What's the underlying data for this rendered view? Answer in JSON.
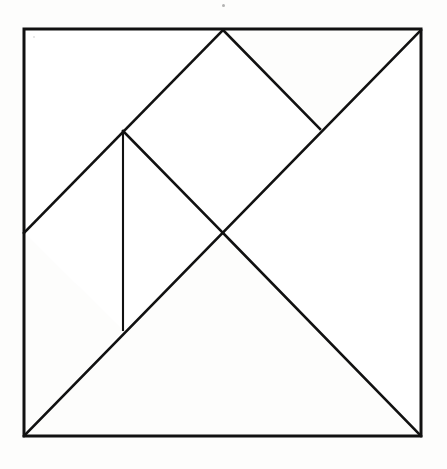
{
  "figure": {
    "kind": "tangram-dissection-diagram",
    "title": "",
    "background_color": "#fdfdfc",
    "stroke_color": "#111111",
    "outer_stroke_width": 3,
    "inner_stroke_width": 2,
    "canvas": {
      "width": 447,
      "height": 469
    }
  },
  "geometry": {
    "square": {
      "label": "outer-square",
      "top_left": [
        24,
        29
      ],
      "top_right": [
        421,
        30
      ],
      "bottom_right": [
        421,
        436
      ],
      "bottom_left": [
        24,
        436
      ],
      "width": 397,
      "height": 407
    },
    "points": {
      "A_top_left": [
        24,
        29
      ],
      "B_top_mid": [
        223,
        30
      ],
      "C_top_right": [
        421,
        30
      ],
      "D_right_small": [
        320,
        129
      ],
      "E_left_mid": [
        24,
        233
      ],
      "F_center": [
        223,
        233
      ],
      "G_upper_left_mid": [
        123,
        131
      ],
      "H_vertical_foot": [
        123,
        330
      ],
      "I_bottom_left": [
        24,
        436
      ],
      "J_bottom_right": [
        421,
        436
      ]
    },
    "lines": [
      {
        "name": "main-diagonal",
        "from": "I_bottom_left",
        "to": "C_top_right",
        "points": [
          [
            24,
            436
          ],
          [
            421,
            30
          ]
        ]
      },
      {
        "name": "left-upper-diagonal",
        "from": "E_left_mid",
        "to": "B_top_mid",
        "points": [
          [
            24,
            233
          ],
          [
            223,
            30
          ]
        ]
      },
      {
        "name": "top-right-short-diagonal",
        "from": "B_top_mid",
        "to": "D_right_small",
        "points": [
          [
            223,
            30
          ],
          [
            320,
            129
          ]
        ]
      },
      {
        "name": "center-upleft-diagonal",
        "from": "G_upper_left_mid",
        "to": "F_center",
        "points": [
          [
            123,
            131
          ],
          [
            223,
            233
          ]
        ]
      },
      {
        "name": "vertical-divider",
        "from": "G_upper_left_mid",
        "to": "H_vertical_foot",
        "points": [
          [
            123,
            131
          ],
          [
            123,
            330
          ]
        ]
      },
      {
        "name": "center-to-bottom-right",
        "from": "F_center",
        "to": "J_bottom_right",
        "points": [
          [
            223,
            233
          ],
          [
            421,
            436
          ]
        ]
      }
    ]
  },
  "pieces": [
    {
      "name": "large-triangle-upper-left",
      "vertices": [
        [
          24,
          29
        ],
        [
          223,
          30
        ],
        [
          24,
          233
        ]
      ]
    },
    {
      "name": "large-triangle-lower-right",
      "vertices": [
        [
          421,
          30
        ],
        [
          421,
          436
        ],
        [
          223,
          233
        ]
      ]
    },
    {
      "name": "medium-triangle-top-right",
      "vertices": [
        [
          223,
          30
        ],
        [
          320,
          129
        ],
        [
          223,
          233
        ]
      ]
    },
    {
      "name": "small-triangle-left",
      "vertices": [
        [
          24,
          233
        ],
        [
          123,
          131
        ],
        [
          123,
          330
        ]
      ]
    },
    {
      "name": "small-triangle-bottom",
      "vertices": [
        [
          123,
          330
        ],
        [
          223,
          233
        ],
        [
          24,
          436
        ]
      ]
    },
    {
      "name": "parallelogram-lower",
      "vertices": [
        [
          123,
          131
        ],
        [
          223,
          233
        ],
        [
          123,
          330
        ]
      ]
    },
    {
      "name": "square-piece-center",
      "vertices": [
        [
          223,
          30
        ],
        [
          320,
          129
        ],
        [
          223,
          233
        ],
        [
          123,
          131
        ]
      ]
    }
  ],
  "artifacts": [
    {
      "name": "scan-speck-top",
      "position": [
        223,
        5
      ],
      "color": "#9a9a9a"
    },
    {
      "name": "scan-speck-inner",
      "position": [
        34,
        37
      ],
      "color": "#cfcfcf"
    }
  ]
}
